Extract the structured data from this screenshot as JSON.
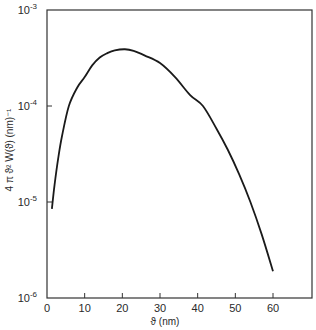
{
  "chart_data": {
    "type": "line",
    "title": "",
    "xlabel": "ϑ (nm)",
    "ylabel": "4 π ϑ² W(ϑ)  (nm)⁻¹",
    "xscale": "linear",
    "yscale": "log",
    "xlim": [
      0,
      70
    ],
    "ylim": [
      1e-06,
      0.001
    ],
    "grid": false,
    "legend": "none",
    "x_ticks": [
      0,
      10,
      20,
      30,
      40,
      50,
      60
    ],
    "x_tick_labels": [
      "0",
      "10",
      "20",
      "30",
      "40",
      "50",
      "60"
    ],
    "y_ticks": [
      0.001,
      0.0001,
      1e-05,
      1e-06
    ],
    "y_tick_labels": [
      {
        "base": "10",
        "exp": "-3"
      },
      {
        "base": "10",
        "exp": "-4"
      },
      {
        "base": "10",
        "exp": "-5"
      },
      {
        "base": "10",
        "exp": "-6"
      }
    ],
    "series": [
      {
        "name": "distribution",
        "x": [
          1.3,
          2,
          3,
          4,
          5.8,
          8,
          10,
          12,
          14,
          16,
          18,
          20.7,
          23,
          26,
          30,
          34,
          38,
          41.4,
          45,
          48,
          51,
          54,
          57,
          60
        ],
        "y": [
          8.5e-06,
          1.5e-05,
          2.9e-05,
          4.9e-05,
          0.0001,
          0.000155,
          0.0002,
          0.000265,
          0.00032,
          0.000355,
          0.00038,
          0.00039,
          0.000375,
          0.000335,
          0.00028,
          0.0002,
          0.00013,
          0.0001,
          5.8e-05,
          3.5e-05,
          1.95e-05,
          1e-05,
          4.6e-06,
          1.9e-06
        ]
      }
    ]
  }
}
